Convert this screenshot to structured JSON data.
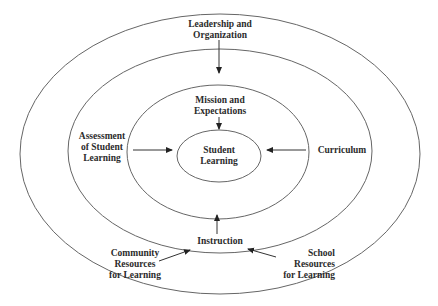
{
  "diagram": {
    "type": "concentric-ellipses",
    "colors": {
      "stroke": "#555555",
      "text": "#2b2b2b",
      "background": "#ffffff"
    },
    "center_label": "Student\nLearning",
    "labels": {
      "leadership": "Leadership and\nOrganization",
      "mission": "Mission and\nExpectations",
      "assessment": "Assessment\nof Student\nLearning",
      "curriculum": "Curriculum",
      "instruction": "Instruction",
      "community": "Community\nResources\nfor Learning",
      "school": "School\nResources\nfor Learning"
    },
    "rings": [
      {
        "name": "outer",
        "cx": 220,
        "cy": 154,
        "rx": 200,
        "ry": 140
      },
      {
        "name": "second",
        "cx": 220,
        "cy": 151,
        "rx": 152,
        "ry": 102
      },
      {
        "name": "third",
        "cx": 218,
        "cy": 152,
        "rx": 91,
        "ry": 67
      },
      {
        "name": "inner",
        "cx": 219,
        "cy": 156,
        "rx": 42,
        "ry": 26
      }
    ],
    "arrows": [
      {
        "from": "Leadership and Organization",
        "to": "Mission and Expectations"
      },
      {
        "from": "Mission and Expectations",
        "to": "Student Learning"
      },
      {
        "from": "Assessment of Student Learning",
        "to": "Student Learning"
      },
      {
        "from": "Curriculum",
        "to": "Student Learning"
      },
      {
        "from": "Instruction",
        "to": "Student Learning"
      },
      {
        "from": "Community Resources for Learning",
        "to": "Instruction"
      },
      {
        "from": "School Resources for Learning",
        "to": "Instruction"
      }
    ]
  }
}
